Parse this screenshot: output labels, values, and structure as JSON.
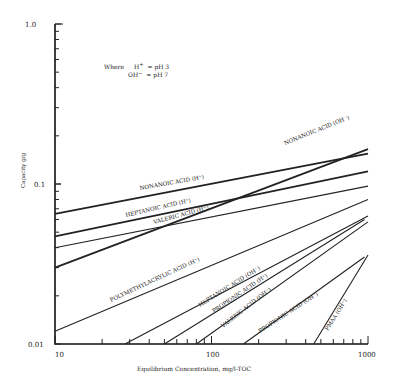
{
  "chart_data": {
    "type": "line",
    "title": "",
    "xlabel": "Equilibrium Concentration, mg/l-TOC",
    "ylabel": "Capacity g/g",
    "xscale": "log",
    "yscale": "log",
    "xlim": [
      10,
      1000
    ],
    "ylim": [
      0.01,
      1.0
    ],
    "x_tick_labels": [
      "10",
      "100",
      "1000"
    ],
    "y_tick_labels": [
      "0.01",
      "0.1",
      "1.0"
    ],
    "grid": false,
    "legend": "none (inline line labels)",
    "annotation": {
      "line1_prefix": "Where",
      "line1_sym": "H",
      "line1_sup": "+",
      "line1_rest": "= pH 3",
      "line2_sym": "OH",
      "line2_sup": "−",
      "line2_rest": "= pH 7"
    },
    "series": [
      {
        "name": "NONANOIC ACID (OH⁻)",
        "x": [
          10,
          1000
        ],
        "y": [
          0.03,
          0.165
        ],
        "bold": true
      },
      {
        "name": "NONANOIC ACID (H⁺)",
        "x": [
          10,
          1000
        ],
        "y": [
          0.065,
          0.155
        ],
        "bold": true
      },
      {
        "name": "HEPTANOIC ACID (H⁺)",
        "x": [
          10,
          1000
        ],
        "y": [
          0.047,
          0.12
        ],
        "bold": true
      },
      {
        "name": "VALERIC ACID (H⁺)",
        "x": [
          10,
          1000
        ],
        "y": [
          0.04,
          0.097
        ],
        "bold": false
      },
      {
        "name": "POLYMETHYLACRYLIC ACID (H⁺)",
        "x": [
          10,
          1000
        ],
        "y": [
          0.012,
          0.08
        ],
        "bold": false
      },
      {
        "name": "HEPTANOIC ACID (OH⁻)",
        "x": [
          28,
          1000
        ],
        "y": [
          0.01,
          0.063
        ],
        "bold": false
      },
      {
        "name": "PROPIONIC ACID (H⁺)",
        "x": [
          50,
          950
        ],
        "y": [
          0.01,
          0.06
        ],
        "bold": false
      },
      {
        "name": "VALERIC ACID (OH⁻)",
        "x": [
          80,
          1000
        ],
        "y": [
          0.01,
          0.058
        ],
        "bold": false
      },
      {
        "name": "PROPIONIC ACID (OH⁻)",
        "x": [
          160,
          950
        ],
        "y": [
          0.01,
          0.035
        ],
        "bold": false
      },
      {
        "name": "PMAA (OH⁻)",
        "x": [
          450,
          1000
        ],
        "y": [
          0.01,
          0.036
        ],
        "bold": false
      }
    ],
    "labels": [
      {
        "text": "NONANOIC ACID (OH⁻)",
        "x": 285,
        "y": 145,
        "angle": -22
      },
      {
        "text": "NONANOIC ACID (H⁺)",
        "x": 140,
        "y": 190,
        "angle": -10
      },
      {
        "text": "HEPTANOIC ACID (H⁺)",
        "x": 126,
        "y": 217,
        "angle": -13
      },
      {
        "text": "VALERIC ACID (H⁺)",
        "x": 154,
        "y": 224,
        "angle": -15
      },
      {
        "text": "POLYMETHYLACRYLIC ACID (H⁺)",
        "x": 111,
        "y": 302,
        "angle": -25
      },
      {
        "text": "HEPTANOIC ACID (OH⁻)",
        "x": 200,
        "y": 307,
        "angle": -32
      },
      {
        "text": "PROPIONIC ACID (H⁺)",
        "x": 214,
        "y": 313,
        "angle": -34
      },
      {
        "text": "VALERIC ACID (OH⁻)",
        "x": 223,
        "y": 328,
        "angle": -38
      },
      {
        "text": "PROPIONIC ACID (OH⁻)",
        "x": 260,
        "y": 333,
        "angle": -33
      },
      {
        "text": "PMAA (OH⁻)",
        "x": 328,
        "y": 331,
        "angle": -58
      }
    ]
  }
}
